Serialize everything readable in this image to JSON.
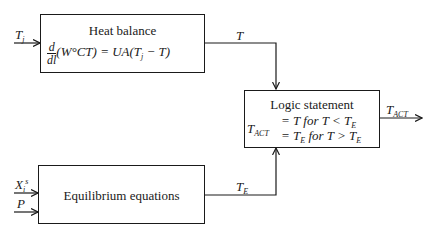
{
  "diagram": {
    "heat_balance": {
      "title": "Heat balance",
      "eq_num": "d",
      "eq_den": "dl",
      "eq_lhs": "(W°CT) = UA(T",
      "eq_sub": "j",
      "eq_rhs": " − T)"
    },
    "logic": {
      "title": "Logic statement",
      "lhs_var": "T",
      "lhs_sub": "ACT",
      "line1_a": "= T for T < T",
      "line1_sub": "E",
      "line2_a": "= T",
      "line2_sub1": "E",
      "line2_b": " for T > T",
      "line2_sub2": "E"
    },
    "equilibrium": {
      "title": "Equilibrium equations"
    },
    "signals": {
      "tj_var": "T",
      "tj_sub": "j",
      "t_label": "T",
      "te_var": "T",
      "te_sub": "E",
      "tact_var": "T",
      "tact_sub": "ACT",
      "x_var": "X",
      "x_sub": "i",
      "x_sup": "s",
      "p_label": "P"
    }
  }
}
